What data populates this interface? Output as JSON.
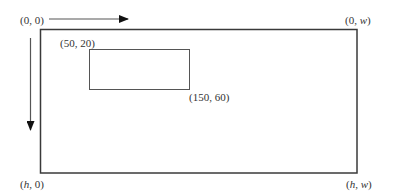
{
  "diagram": {
    "corners": {
      "top_left": "(0, 0)",
      "top_right_prefix": "(0, ",
      "top_right_var": "w",
      "bottom_left_var": "h",
      "bottom_left_suffix": ", 0)",
      "bottom_right_h": "h",
      "bottom_right_w": "w"
    },
    "roi": {
      "top_left_label": "(50, 20)",
      "bottom_right_label": "(150, 60)"
    },
    "arrows": {
      "horizontal": "x-axis-direction",
      "vertical": "y-axis-direction"
    },
    "colors": {
      "frame": "#3a3a3a",
      "roi": "#555555",
      "arrow": "#111111",
      "text": "#333333"
    }
  }
}
